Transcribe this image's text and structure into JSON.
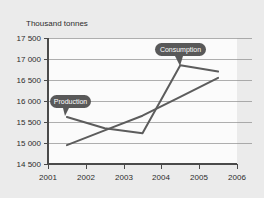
{
  "chart_data": {
    "type": "line",
    "title": "",
    "subtitle": "",
    "ylabel": "Thousand tonnes",
    "xlabel": "",
    "ylim": [
      14500,
      17500
    ],
    "xlim": [
      2001,
      2006
    ],
    "y_ticks": [
      "14 500",
      "15 000",
      "15 500",
      "16 000",
      "16 500",
      "17 000",
      "17 500"
    ],
    "y_tick_values": [
      14500,
      15000,
      15500,
      16000,
      16500,
      17000,
      17500
    ],
    "x_ticks": [
      "2001",
      "2002",
      "2003",
      "2004",
      "2005",
      "2006"
    ],
    "x_tick_values": [
      2001,
      2002,
      2003,
      2004,
      2005,
      2006
    ],
    "grid": true,
    "legend": "callout-labels",
    "series": [
      {
        "name": "Consumption",
        "x": [
          2001.5,
          2002.5,
          2003.5,
          2004.5,
          2005.5
        ],
        "values": [
          15620,
          15350,
          15230,
          16850,
          16700
        ]
      },
      {
        "name": "Production",
        "x": [
          2001.5,
          2002.5,
          2003.5,
          2004.5,
          2005.5
        ],
        "values": [
          14950,
          15300,
          15650,
          16100,
          16550
        ]
      }
    ],
    "annotations": [
      {
        "label": "Production",
        "target_series": "Consumption",
        "target_x": 2001.5,
        "target_y": 15620
      },
      {
        "label": "Consumption",
        "target_series": "Consumption",
        "target_x": 2004.5,
        "target_y": 16850
      }
    ]
  },
  "colors": {
    "background": "#ebebeb",
    "plot_area": "#fbfbfb",
    "line": "#5c5c5c",
    "gridline": "#8d8d8d",
    "axis": "#4a4a4a",
    "callout_fill": "#595959",
    "callout_text": "#ffffff",
    "tick_text": "#2b2b2b"
  },
  "axis": {
    "y_title": "Thousand tonnes"
  },
  "ticks": {
    "y": [
      {
        "label": "17 500"
      },
      {
        "label": "17 000"
      },
      {
        "label": "16 500"
      },
      {
        "label": "16 000"
      },
      {
        "label": "15 500"
      },
      {
        "label": "15 000"
      },
      {
        "label": "14 500"
      }
    ],
    "x": [
      {
        "label": "2001"
      },
      {
        "label": "2002"
      },
      {
        "label": "2003"
      },
      {
        "label": "2004"
      },
      {
        "label": "2005"
      },
      {
        "label": "2006"
      }
    ]
  },
  "callouts": {
    "production": {
      "label": "Production"
    },
    "consumption": {
      "label": "Consumption"
    }
  }
}
